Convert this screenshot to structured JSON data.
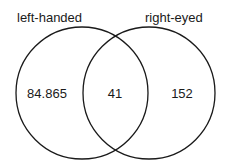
{
  "diagram": {
    "type": "venn",
    "sets": [
      {
        "label": "left-handed",
        "only_value": "84.865"
      },
      {
        "label": "right-eyed",
        "only_value": "152"
      }
    ],
    "intersection_value": "41"
  },
  "colors": {
    "stroke": "#1a1a1a",
    "text": "#1a1a1a",
    "background": "#ffffff"
  }
}
